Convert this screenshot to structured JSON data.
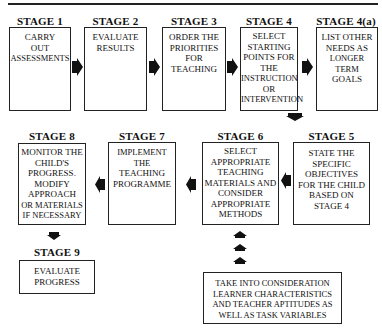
{
  "stages": [
    {
      "id": "1",
      "heading": "STAGE 1",
      "lines": [
        "CARRY",
        "OUT",
        "ASSESSMENTS"
      ]
    },
    {
      "id": "2",
      "heading": "STAGE 2",
      "lines": [
        "EVALUATE",
        "RESULTS"
      ]
    },
    {
      "id": "3",
      "heading": "STAGE 3",
      "lines": [
        "ORDER THE",
        "PRIORITIES",
        "FOR",
        "TEACHING"
      ]
    },
    {
      "id": "4",
      "heading": "STAGE 4",
      "lines": [
        "SELECT",
        "STARTING",
        "POINTS FOR",
        "THE",
        "INSTRUCTION",
        "OR",
        "INTERVENTION"
      ]
    },
    {
      "id": "4a",
      "heading": "STAGE 4(a)",
      "lines": [
        "LIST OTHER",
        "NEEDS AS",
        "LONGER TERM",
        "GOALS"
      ]
    },
    {
      "id": "5",
      "heading": "STAGE 5",
      "lines": [
        "STATE THE",
        "SPECIFIC",
        "OBJECTIVES",
        "FOR THE CHILD",
        "BASED ON",
        "STAGE 4"
      ]
    },
    {
      "id": "6",
      "heading": "STAGE 6",
      "lines": [
        "SELECT",
        "APPROPRIATE",
        "TEACHING",
        "MATERIALS AND",
        "CONSIDER",
        "APPROPRIATE",
        "METHODS"
      ]
    },
    {
      "id": "7",
      "heading": "STAGE 7",
      "lines": [
        "IMPLEMENT THE",
        "TEACHING",
        "PROGRAMME"
      ]
    },
    {
      "id": "8",
      "heading": "STAGE 8",
      "lines": [
        "MONITOR THE",
        "CHILD'S",
        "PROGRESS.",
        "MODIFY",
        "APPROACH",
        "OR MATERIALS",
        "IF NECESSARY"
      ]
    },
    {
      "id": "9",
      "heading": "STAGE 9",
      "lines": [
        "EVALUATE",
        "PROGRESS"
      ]
    }
  ],
  "considerations": {
    "lines": [
      "TAKE INTO CONSIDERATION",
      "LEARNER CHARACTERISTICS",
      "AND TEACHER APTITUDES AS",
      "WELL AS TASK VARIABLES"
    ]
  },
  "arrows": {
    "icon": "block-arrow-icon",
    "color": "#111111"
  }
}
